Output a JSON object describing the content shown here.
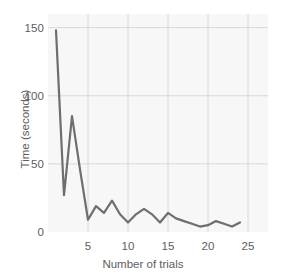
{
  "chart_data": {
    "type": "line",
    "title": "",
    "xlabel": "Number of trials",
    "ylabel": "Time (seconds)",
    "xlim": [
      0,
      27.5
    ],
    "ylim": [
      0,
      160
    ],
    "xticks": [
      5,
      10,
      15,
      20,
      25
    ],
    "yticks": [
      0,
      50,
      100,
      150
    ],
    "xtick_labels": [
      "5",
      "10",
      "15",
      "20",
      "25"
    ],
    "ytick_labels": [
      "0",
      "50",
      "100",
      "150"
    ],
    "grid": true,
    "legend": "none",
    "line_color": "#6e6e6e",
    "line_width": 2.2,
    "plot_background": "#f7f7f7",
    "grid_color": "#d8d8d8",
    "x": [
      1,
      2,
      3,
      4,
      5,
      6,
      7,
      8,
      9,
      10,
      11,
      12,
      13,
      14,
      15,
      16,
      17,
      18,
      19,
      20,
      21,
      22,
      23,
      24
    ],
    "values": [
      148,
      27,
      85,
      46,
      9,
      19,
      14,
      23,
      13,
      7,
      13,
      17,
      13,
      7,
      14,
      10,
      8,
      6,
      4,
      5,
      8,
      6,
      4,
      7
    ],
    "series": [
      {
        "name": "Time per trial",
        "values": [
          148,
          27,
          85,
          46,
          9,
          19,
          14,
          23,
          13,
          7,
          13,
          17,
          13,
          7,
          14,
          10,
          8,
          6,
          4,
          5,
          8,
          6,
          4,
          7
        ]
      }
    ],
    "annotations": []
  }
}
